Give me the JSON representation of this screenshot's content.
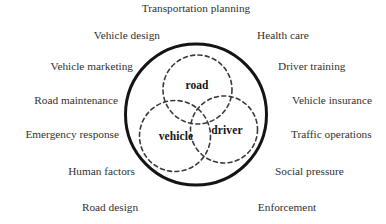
{
  "figure": {
    "type": "venn-diagram",
    "title": "Transportation planning"
  },
  "colors": {
    "outer_circle_stroke": "#141414",
    "inner_circle_stroke": "#3a3a3a",
    "set_label_text": "#141414",
    "context_label_text": "#33312f",
    "background": "#ffffff"
  },
  "venn": {
    "outer_circle": {
      "name": "road-transport-system-boundary",
      "cx": 196,
      "cy": 114.5,
      "r": 70.5,
      "stroke_width": 3,
      "dashed": false
    },
    "sets": [
      {
        "id": "road",
        "label": "road",
        "cx": 197.5,
        "cy": 89.5,
        "r": 34.5,
        "dashed": true
      },
      {
        "id": "vehicle",
        "label": "vehicle",
        "cx": 175,
        "cy": 136,
        "r": 35.5,
        "dashed": true
      },
      {
        "id": "driver",
        "label": "driver",
        "cx": 224,
        "cy": 129.5,
        "r": 33.5,
        "dashed": true
      }
    ]
  },
  "context_labels": {
    "top": [
      {
        "id": "transportation-planning",
        "label": "Transportation planning"
      }
    ],
    "left": [
      {
        "id": "vehicle-design",
        "label": "Vehicle design"
      },
      {
        "id": "vehicle-marketing",
        "label": "Vehicle marketing"
      },
      {
        "id": "road-maintenance",
        "label": "Road maintenance"
      },
      {
        "id": "emergency-response",
        "label": "Emergency response"
      },
      {
        "id": "human-factors",
        "label": "Human factors"
      }
    ],
    "right": [
      {
        "id": "health-care",
        "label": "Health care"
      },
      {
        "id": "driver-training",
        "label": "Driver training"
      },
      {
        "id": "vehicle-insurance",
        "label": "Vehicle insurance"
      },
      {
        "id": "traffic-operations",
        "label": "Traffic operations"
      },
      {
        "id": "social-pressure",
        "label": "Social pressure"
      }
    ],
    "bottom": [
      {
        "id": "road-design",
        "label": "Road design"
      },
      {
        "id": "enforcement",
        "label": "Enforcement"
      }
    ]
  }
}
